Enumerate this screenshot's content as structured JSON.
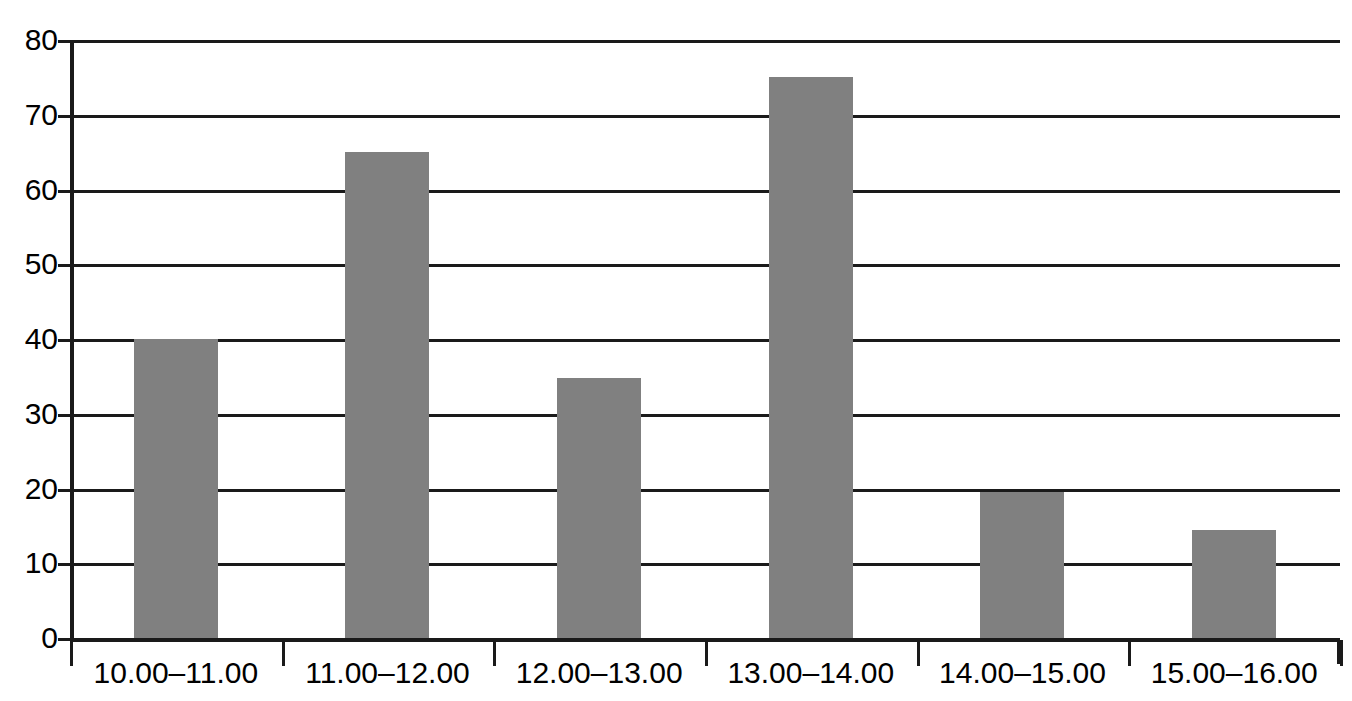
{
  "chart_data": {
    "type": "bar",
    "title": "",
    "subtitle": "",
    "xlabel": "",
    "ylabel": "",
    "categories": [
      "10.00–11.00",
      "11.00–12.00",
      "12.00–13.00",
      "13.00–14.00",
      "14.00–15.00",
      "15.00–16.00"
    ],
    "values": [
      40,
      65,
      34.8,
      75,
      19.5,
      14.5
    ],
    "ylim": [
      0,
      80
    ],
    "ytick_labels": [
      "80",
      "70",
      "60",
      "50",
      "40",
      "30",
      "20",
      "10",
      "0"
    ],
    "ytick_values": [
      80,
      70,
      60,
      50,
      40,
      30,
      20,
      10,
      0
    ],
    "grid": true,
    "legend": false,
    "legend_position": "none",
    "bar_color": "#808080",
    "axis_color": "#1a1a1a",
    "background_color": "#ffffff"
  }
}
